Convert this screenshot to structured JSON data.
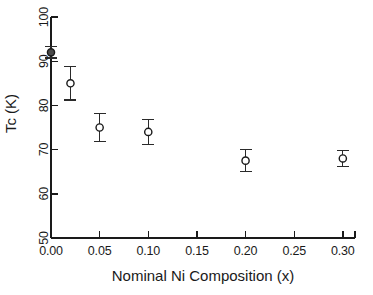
{
  "chart_data": {
    "type": "scatter",
    "title": "",
    "xlabel": "Nominal Ni Composition (x)",
    "ylabel": "Tc (K)",
    "xlim": [
      0.0,
      0.3125
    ],
    "ylim": [
      50,
      100
    ],
    "xticks": [
      0.0,
      0.05,
      0.1,
      0.15,
      0.2,
      0.25,
      0.3
    ],
    "xticklabels": [
      "0.00",
      "0.05",
      "0.10",
      "0.15",
      "0.20",
      "0.25",
      "0.30"
    ],
    "yticks": [
      50,
      60,
      70,
      80,
      90,
      100
    ],
    "yticklabels": [
      "50",
      "60",
      "70",
      "80",
      "90",
      "100"
    ],
    "grid": false,
    "legend": null,
    "marker": "open-circle",
    "errorbars": true,
    "spines": [
      "left",
      "bottom"
    ],
    "tick_direction": "in",
    "x": [
      0.0,
      0.02,
      0.05,
      0.1,
      0.2,
      0.3
    ],
    "values": [
      92.0,
      85.0,
      75.0,
      74.0,
      67.5,
      68.0
    ],
    "yerr": [
      1.3,
      3.8,
      3.2,
      2.8,
      2.5,
      1.8
    ],
    "points": [
      {
        "x": 0.0,
        "y": 92.0,
        "err": 1.3,
        "filled": true
      },
      {
        "x": 0.02,
        "y": 85.0,
        "err": 3.8,
        "filled": false
      },
      {
        "x": 0.05,
        "y": 75.0,
        "err": 3.2,
        "filled": false
      },
      {
        "x": 0.1,
        "y": 74.0,
        "err": 2.8,
        "filled": false
      },
      {
        "x": 0.2,
        "y": 67.5,
        "err": 2.5,
        "filled": false
      },
      {
        "x": 0.3,
        "y": 68.0,
        "err": 1.8,
        "filled": false
      }
    ]
  }
}
